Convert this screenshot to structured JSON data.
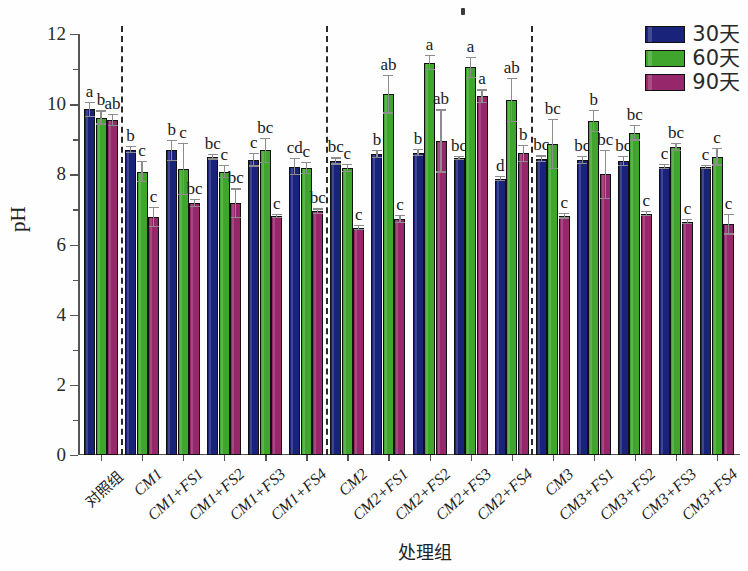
{
  "chart_data": {
    "type": "bar",
    "title": "",
    "xlabel": "处理组",
    "ylabel": "pH",
    "ylim": [
      0,
      12
    ],
    "ytick_labels": [
      "0",
      "2",
      "4",
      "6",
      "8",
      "10",
      "12"
    ],
    "ytick_values": [
      0,
      2,
      4,
      6,
      8,
      10,
      12
    ],
    "grid": false,
    "legend_position": "top-right",
    "categories": [
      "对照组",
      "CM1",
      "CM1+FS1",
      "CM1+FS2",
      "CM1+FS3",
      "CM1+FS4",
      "CM2",
      "CM2+FS1",
      "CM2+FS2",
      "CM2+FS3",
      "CM2+FS4",
      "CM3",
      "CM3+FS1",
      "CM3+FS2",
      "CM3+FS3",
      "CM3+FS4"
    ],
    "series": [
      {
        "name": "30天",
        "color": "#19237a",
        "values": [
          9.85,
          8.7,
          8.68,
          8.5,
          8.42,
          8.22,
          8.38,
          8.58,
          8.62,
          8.46,
          7.88,
          8.44,
          8.4,
          8.38,
          8.22,
          8.2
        ],
        "errors": [
          0.22,
          0.1,
          0.3,
          0.08,
          0.2,
          0.25,
          0.1,
          0.12,
          0.1,
          0.06,
          0.08,
          0.1,
          0.12,
          0.15,
          0.08,
          0.06
        ],
        "labels": [
          "a",
          "b",
          "b",
          "bc",
          "c",
          "cd",
          "bc",
          "b",
          "b",
          "bc",
          "d",
          "bc",
          "bc",
          "bc",
          "c",
          "c"
        ]
      },
      {
        "name": "60天",
        "color": "#3fa52c",
        "values": [
          9.62,
          8.08,
          8.15,
          8.08,
          8.68,
          8.18,
          8.18,
          10.28,
          11.18,
          11.05,
          10.12,
          8.86,
          9.52,
          9.18,
          8.78,
          8.5
        ],
        "errors": [
          0.2,
          0.3,
          0.75,
          0.18,
          0.35,
          0.18,
          0.12,
          0.55,
          0.22,
          0.3,
          0.62,
          0.72,
          0.32,
          0.22,
          0.12,
          0.25
        ],
        "labels": [
          "b",
          "c",
          "c",
          "c",
          "bc",
          "c",
          "c",
          "ab",
          "a",
          "a",
          "ab",
          "bc",
          "b",
          "bc",
          "bc",
          "c"
        ]
      },
      {
        "name": "90天",
        "color": "#96276b",
        "values": [
          9.55,
          6.78,
          7.18,
          7.18,
          6.82,
          6.95,
          6.48,
          6.72,
          8.95,
          10.22,
          8.6,
          6.82,
          8.0,
          6.88,
          6.65,
          6.58
        ],
        "errors": [
          0.18,
          0.28,
          0.12,
          0.42,
          0.06,
          0.08,
          0.08,
          0.12,
          0.9,
          0.2,
          0.25,
          0.08,
          0.7,
          0.08,
          0.08,
          0.3
        ],
        "labels": [
          "ab",
          "c",
          "bc",
          "bc",
          "c",
          "bc",
          "c",
          "c",
          "ab",
          "a",
          "b",
          "c",
          "bc",
          "c",
          "c",
          "c"
        ]
      }
    ],
    "group_separators_after": [
      1,
      6,
      11
    ]
  },
  "legend": {
    "items": [
      {
        "label": "30天",
        "color": "#19237a"
      },
      {
        "label": "60天",
        "color": "#3fa52c"
      },
      {
        "label": "90天",
        "color": "#96276b"
      }
    ]
  }
}
